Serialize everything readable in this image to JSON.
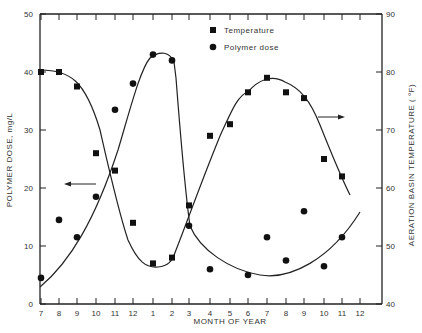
{
  "chart_data": {
    "type": "scatter",
    "title": "",
    "xlabel": "MONTH OF YEAR",
    "ylabel": "POLYMER DOSE, mg/L",
    "y2label": "AERATION BASIN TEMPERATURE ( °F)",
    "x_tick_labels": [
      "7",
      "8",
      "9",
      "10",
      "11",
      "12",
      "1",
      "2",
      "3",
      "4",
      "5",
      "6",
      "7",
      "8",
      "9",
      "10",
      "11",
      "12"
    ],
    "ylim": [
      0,
      50
    ],
    "y_ticks": [
      0,
      10,
      20,
      30,
      40,
      50
    ],
    "y2lim": [
      40,
      90
    ],
    "y2_ticks": [
      40,
      50,
      60,
      70,
      80,
      90
    ],
    "grid": false,
    "legend": {
      "position": "top-right-inside",
      "entries": [
        "Temperature",
        "Polymer dose"
      ]
    },
    "series": [
      {
        "name": "Temperature",
        "marker": "square",
        "axis": "right",
        "x_index": [
          0,
          1,
          2,
          3,
          4,
          5,
          6,
          7,
          8,
          9,
          10,
          11,
          12,
          13,
          14,
          15,
          16
        ],
        "values": [
          80,
          80,
          77.5,
          66,
          63,
          54,
          47,
          48,
          57,
          69,
          71,
          76.5,
          79,
          76.5,
          75.5,
          65,
          62
        ]
      },
      {
        "name": "Polymer dose",
        "marker": "circle",
        "axis": "left",
        "x_index": [
          0,
          1,
          2,
          3,
          4,
          5,
          6,
          7,
          8,
          9,
          11,
          12,
          13,
          14,
          15,
          16
        ],
        "values": [
          4.5,
          14.5,
          11.5,
          18.5,
          33.5,
          38,
          43,
          42,
          13.5,
          6,
          5,
          11.5,
          7.5,
          16,
          6.5,
          11.5
        ]
      }
    ],
    "annotations": [
      {
        "type": "arrow",
        "direction": "left",
        "text": "",
        "points_to": "left axis (polymer dose curve)"
      },
      {
        "type": "arrow",
        "direction": "right",
        "text": "",
        "points_to": "right axis (temperature curve)"
      }
    ]
  },
  "axes": {
    "left_label": "POLYMER DOSE, mg/L",
    "right_label": "AERATION BASIN TEMPERATURE ( °F)",
    "x_label": "MONTH OF YEAR"
  },
  "legend": {
    "temperature": "Temperature",
    "polymer": "Polymer dose"
  }
}
